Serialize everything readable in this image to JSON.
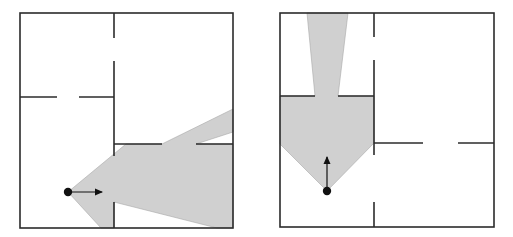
{
  "figure": {
    "colors": {
      "wall": "#2b2b2b",
      "visibility_fill": "#d0d0d0",
      "viewpoint": "#111111",
      "background": "#ffffff"
    },
    "panels": [
      {
        "id": "left",
        "heading": "right",
        "viewpoint": {
          "x": 68,
          "y": 192
        },
        "arrow_end": {
          "x": 102,
          "y": 192
        }
      },
      {
        "id": "right",
        "heading": "up",
        "viewpoint": {
          "x": 327,
          "y": 191
        },
        "arrow_end": {
          "x": 327,
          "y": 157
        }
      }
    ]
  }
}
